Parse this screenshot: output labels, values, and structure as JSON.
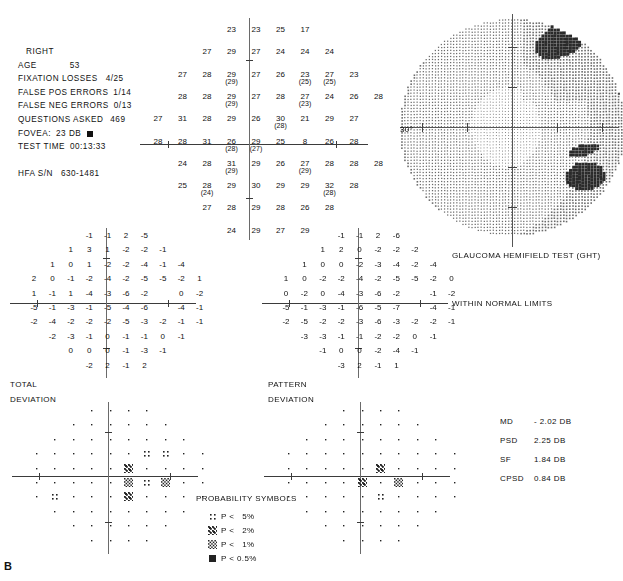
{
  "report": {
    "panel_label": "B",
    "eye": "RIGHT",
    "header_rows": [
      {
        "label": "AGE",
        "value": "53"
      },
      {
        "label": "FIXATION LOSSES",
        "value": "4/25"
      },
      {
        "label": "FALSE POS ERRORS",
        "value": "1/14"
      },
      {
        "label": "FALSE NEG ERRORS",
        "value": "0/13"
      },
      {
        "label": "QUESTIONS ASKED",
        "value": "469"
      },
      {
        "label": "FOVEA:",
        "value": "23 DB"
      },
      {
        "label": "TEST TIME",
        "value": "00:13:33"
      },
      {
        "label": "HFA S/N",
        "value": "630-1481"
      }
    ],
    "fovea_symbol": "filled-square",
    "grayscale_axis_label": "30°",
    "ght_title": "GLAUCOMA HEMIFIELD TEST (GHT)",
    "ght_result": "WITHIN NORMAL LIMITS",
    "total_deviation_label_l1": "TOTAL",
    "total_deviation_label_l2": "DEVIATION",
    "pattern_deviation_label_l1": "PATTERN",
    "pattern_deviation_label_l2": "DEVIATION",
    "indices": [
      {
        "name": "MD",
        "value": "- 2.02 DB"
      },
      {
        "name": "PSD",
        "value": "2.25 DB"
      },
      {
        "name": "SF",
        "value": "1.84 DB"
      },
      {
        "name": "CPSD",
        "value": "0.84 DB"
      }
    ],
    "probability_legend_title": "PROBABILITY SYMBOLS",
    "probability_legend": [
      {
        "symbol": "p5",
        "text": "P <   5%"
      },
      {
        "symbol": "p2",
        "text": "P <   2%"
      },
      {
        "symbol": "p1",
        "text": "P <   1%"
      },
      {
        "symbol": "p05",
        "text": "P < 0.5%"
      }
    ]
  },
  "chart_data": {
    "type": "table",
    "threshold_grid": {
      "description": "Threshold sensitivities in dB; values in parentheses are retest values at seed points",
      "xlabel": "Horizontal meridian (degrees)",
      "ylabel": "Vertical meridian (degrees)",
      "rows": [
        [
          null,
          null,
          null,
          "23",
          "23",
          "25",
          "17",
          null,
          null,
          null
        ],
        [
          null,
          null,
          "27",
          "29",
          "27",
          "24",
          "24",
          "24",
          null,
          null
        ],
        [
          null,
          "27",
          "28",
          "29",
          "27",
          "26",
          "23",
          "27",
          "23",
          null
        ],
        [
          null,
          "28",
          "28",
          "29",
          "27",
          "28",
          "27",
          "24",
          "26",
          "28"
        ],
        [
          "27",
          "31",
          "28",
          "29",
          "26",
          "30",
          "21",
          "29",
          "27",
          null
        ],
        [
          "28",
          "28",
          "31",
          "26",
          "29",
          "25",
          "8",
          "26",
          "28",
          null
        ],
        [
          null,
          "24",
          "28",
          "31",
          "29",
          "26",
          "27",
          "28",
          "28",
          "28"
        ],
        [
          null,
          "25",
          "28",
          "29",
          "30",
          "29",
          "29",
          "32",
          "28",
          null
        ],
        [
          null,
          null,
          "27",
          "28",
          "29",
          "28",
          "26",
          "28",
          null,
          null
        ],
        [
          null,
          null,
          null,
          "24",
          "29",
          "27",
          "29",
          null,
          null,
          null
        ]
      ],
      "retest_rows": [
        [
          null,
          null,
          null,
          null,
          null,
          null,
          null,
          null,
          null,
          null
        ],
        [
          null,
          null,
          null,
          null,
          null,
          null,
          null,
          null,
          null,
          null
        ],
        [
          null,
          null,
          null,
          "(29)",
          null,
          null,
          "(25)",
          "(25)",
          null,
          null
        ],
        [
          null,
          null,
          null,
          "(29)",
          null,
          null,
          "(23)",
          null,
          null,
          null
        ],
        [
          null,
          null,
          null,
          null,
          null,
          "(28)",
          null,
          null,
          null,
          null
        ],
        [
          null,
          null,
          null,
          "(28)",
          "(27)",
          null,
          null,
          null,
          null,
          null
        ],
        [
          null,
          null,
          null,
          "(29)",
          null,
          null,
          "(29)",
          null,
          null,
          null
        ],
        [
          null,
          null,
          "(24)",
          null,
          null,
          null,
          null,
          "(28)",
          null,
          null
        ],
        [
          null,
          null,
          null,
          null,
          null,
          null,
          null,
          null,
          null,
          null
        ],
        [
          null,
          null,
          null,
          null,
          null,
          null,
          null,
          null,
          null,
          null
        ]
      ]
    },
    "total_deviation_grid": {
      "description": "Total deviation values in dB",
      "rows": [
        [
          null,
          null,
          null,
          "-1",
          "-1",
          "2",
          "-5",
          null,
          null,
          null
        ],
        [
          null,
          null,
          "1",
          "3",
          "1",
          "-2",
          "-2",
          "-1",
          null,
          null
        ],
        [
          null,
          "1",
          "0",
          "1",
          "-2",
          "-2",
          "-4",
          "-1",
          "-4",
          null
        ],
        [
          "2",
          "0",
          "-1",
          "-2",
          "-4",
          "-2",
          "-5",
          "-5",
          "-2",
          "1"
        ],
        [
          "1",
          "-1",
          "1",
          "-4",
          "-3",
          "-6",
          "-2",
          "",
          "0",
          "-2"
        ],
        [
          "-5",
          "-1",
          "-3",
          "-1",
          "-5",
          "-4",
          "-6",
          "",
          "-4",
          "-1"
        ],
        [
          "-2",
          "-4",
          "-2",
          "-2",
          "-2",
          "-5",
          "-3",
          "-2",
          "-1",
          "-1"
        ],
        [
          null,
          "-2",
          "-3",
          "-1",
          "0",
          "-1",
          "-1",
          "0",
          "-1",
          null
        ],
        [
          null,
          null,
          "0",
          "0",
          "0",
          "-1",
          "-3",
          "-1",
          null,
          null
        ],
        [
          null,
          null,
          null,
          "-2",
          "2",
          "-1",
          "2",
          null,
          null,
          null
        ]
      ]
    },
    "pattern_deviation_grid": {
      "description": "Pattern deviation values in dB",
      "rows": [
        [
          null,
          null,
          null,
          "-1",
          "-1",
          "2",
          "-6",
          null,
          null,
          null
        ],
        [
          null,
          null,
          "1",
          "2",
          "0",
          "-2",
          "-2",
          "-2",
          null,
          null
        ],
        [
          null,
          "1",
          "0",
          "0",
          "-2",
          "-3",
          "-4",
          "-2",
          "-4",
          null
        ],
        [
          "1",
          "0",
          "-2",
          "-2",
          "-4",
          "-2",
          "-5",
          "-5",
          "-2",
          "0"
        ],
        [
          "0",
          "-2",
          "0",
          "-4",
          "-3",
          "-6",
          "-2",
          "",
          "-1",
          "-2"
        ],
        [
          "-5",
          "-1",
          "-3",
          "-1",
          "-6",
          "-5",
          "-7",
          "",
          "-4",
          "-1"
        ],
        [
          "-2",
          "-5",
          "-2",
          "-2",
          "-3",
          "-6",
          "-3",
          "-2",
          "-2",
          "-1"
        ],
        [
          null,
          "-3",
          "-3",
          "-1",
          "-1",
          "-2",
          "-2",
          "0",
          "-1",
          null
        ],
        [
          null,
          null,
          "-1",
          "0",
          "0",
          "-2",
          "-4",
          "-1",
          null,
          null
        ],
        [
          null,
          null,
          null,
          "-3",
          "2",
          "-1",
          "1",
          null,
          null,
          null
        ]
      ]
    },
    "total_deviation_probability_plot": {
      "description": "Probability symbols; '.' = within normal limits",
      "rows": [
        [
          null,
          null,
          null,
          ".",
          ".",
          ".",
          ".",
          null,
          null,
          null
        ],
        [
          null,
          null,
          ".",
          ".",
          ".",
          ".",
          ".",
          ".",
          null,
          null
        ],
        [
          null,
          ".",
          ".",
          ".",
          ".",
          ".",
          ".",
          ".",
          ".",
          null
        ],
        [
          ".",
          ".",
          ".",
          ".",
          ".",
          ".",
          "p5",
          "p5",
          ".",
          "."
        ],
        [
          ".",
          ".",
          ".",
          ".",
          ".",
          "p2",
          ".",
          ".",
          ".",
          "."
        ],
        [
          ".",
          ".",
          ".",
          ".",
          ".",
          "p1",
          "p5",
          "p1",
          ".",
          "."
        ],
        [
          ".",
          "p5",
          ".",
          ".",
          ".",
          "p2",
          ".",
          ".",
          ".",
          "."
        ],
        [
          null,
          ".",
          ".",
          ".",
          ".",
          ".",
          ".",
          ".",
          ".",
          null
        ],
        [
          null,
          null,
          ".",
          ".",
          ".",
          ".",
          ".",
          ".",
          null,
          null
        ],
        [
          null,
          null,
          null,
          ".",
          ".",
          ".",
          ".",
          null,
          null,
          null
        ]
      ]
    },
    "pattern_deviation_probability_plot": {
      "description": "Probability symbols; '.' = within normal limits",
      "rows": [
        [
          null,
          null,
          null,
          ".",
          ".",
          ".",
          ".",
          null,
          null,
          null
        ],
        [
          null,
          null,
          ".",
          ".",
          ".",
          ".",
          ".",
          ".",
          null,
          null
        ],
        [
          null,
          ".",
          ".",
          ".",
          ".",
          ".",
          ".",
          ".",
          ".",
          null
        ],
        [
          ".",
          ".",
          ".",
          ".",
          ".",
          ".",
          ".",
          ".",
          ".",
          "."
        ],
        [
          ".",
          ".",
          ".",
          ".",
          ".",
          "p2",
          ".",
          ".",
          ".",
          "."
        ],
        [
          ".",
          ".",
          ".",
          ".",
          "p2",
          ".",
          "p1",
          ".",
          ".",
          "."
        ],
        [
          ".",
          ".",
          ".",
          ".",
          ".",
          "p5",
          ".",
          ".",
          ".",
          "."
        ],
        [
          null,
          ".",
          ".",
          ".",
          ".",
          ".",
          ".",
          ".",
          ".",
          null
        ],
        [
          null,
          null,
          ".",
          ".",
          ".",
          ".",
          ".",
          ".",
          null,
          null
        ],
        [
          null,
          null,
          null,
          ".",
          ".",
          ".",
          ".",
          null,
          null,
          null
        ]
      ]
    },
    "grayscale_map": {
      "description": "Stippled grayscale representation of the visual field; darker regions = reduced sensitivity",
      "defect_patches": [
        {
          "location": "superior-nasal",
          "severity": "dark"
        },
        {
          "location": "blind-spot",
          "severity": "dark"
        },
        {
          "location": "inferior-nasal-near-blind-spot",
          "severity": "dark"
        }
      ]
    }
  }
}
